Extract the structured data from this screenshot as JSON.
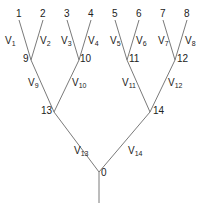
{
  "diagram": {
    "type": "binary-tree",
    "colors": {
      "edge": "#7a7a7a",
      "text": "#222222",
      "background": "#ffffff"
    },
    "nodes": [
      {
        "id": "1",
        "label": "1",
        "x": 19,
        "y": 20,
        "lx": 16,
        "ly": 9,
        "kind": "leaf"
      },
      {
        "id": "2",
        "label": "2",
        "x": 43,
        "y": 20,
        "lx": 40,
        "ly": 9,
        "kind": "leaf"
      },
      {
        "id": "3",
        "label": "3",
        "x": 67,
        "y": 20,
        "lx": 64,
        "ly": 9,
        "kind": "leaf"
      },
      {
        "id": "4",
        "label": "4",
        "x": 91,
        "y": 20,
        "lx": 88,
        "ly": 9,
        "kind": "leaf"
      },
      {
        "id": "5",
        "label": "5",
        "x": 115,
        "y": 20,
        "lx": 112,
        "ly": 9,
        "kind": "leaf"
      },
      {
        "id": "6",
        "label": "6",
        "x": 139,
        "y": 20,
        "lx": 136,
        "ly": 9,
        "kind": "leaf"
      },
      {
        "id": "7",
        "label": "7",
        "x": 163,
        "y": 20,
        "lx": 160,
        "ly": 9,
        "kind": "leaf"
      },
      {
        "id": "8",
        "label": "8",
        "x": 187,
        "y": 20,
        "lx": 184,
        "ly": 9,
        "kind": "leaf"
      },
      {
        "id": "9",
        "label": "9",
        "x": 31,
        "y": 60,
        "lx": 23,
        "ly": 54,
        "kind": "internal"
      },
      {
        "id": "10",
        "label": "10",
        "x": 79,
        "y": 60,
        "lx": 80,
        "ly": 54,
        "kind": "internal"
      },
      {
        "id": "11",
        "label": "11",
        "x": 127,
        "y": 60,
        "lx": 129,
        "ly": 54,
        "kind": "internal"
      },
      {
        "id": "12",
        "label": "12",
        "x": 175,
        "y": 60,
        "lx": 177,
        "ly": 54,
        "kind": "internal"
      },
      {
        "id": "13",
        "label": "13",
        "x": 54,
        "y": 112,
        "lx": 41,
        "ly": 106,
        "kind": "internal"
      },
      {
        "id": "14",
        "label": "14",
        "x": 150,
        "y": 112,
        "lx": 153,
        "ly": 106,
        "kind": "internal"
      },
      {
        "id": "0",
        "label": "0",
        "x": 99,
        "y": 172,
        "lx": 101,
        "ly": 168,
        "kind": "root"
      }
    ],
    "edges": [
      {
        "from": "1",
        "to": "9",
        "label": "V",
        "sub": "1",
        "lx": 5,
        "ly": 36
      },
      {
        "from": "2",
        "to": "9",
        "label": "V",
        "sub": "2",
        "lx": 40,
        "ly": 36
      },
      {
        "from": "3",
        "to": "10",
        "label": "V",
        "sub": "3",
        "lx": 61,
        "ly": 36
      },
      {
        "from": "4",
        "to": "10",
        "label": "V",
        "sub": "4",
        "lx": 88,
        "ly": 36
      },
      {
        "from": "5",
        "to": "11",
        "label": "V",
        "sub": "5",
        "lx": 110,
        "ly": 36
      },
      {
        "from": "6",
        "to": "11",
        "label": "V",
        "sub": "6",
        "lx": 136,
        "ly": 36
      },
      {
        "from": "7",
        "to": "12",
        "label": "V",
        "sub": "7",
        "lx": 158,
        "ly": 36
      },
      {
        "from": "8",
        "to": "12",
        "label": "V",
        "sub": "8",
        "lx": 185,
        "ly": 36
      },
      {
        "from": "9",
        "to": "13",
        "label": "V",
        "sub": "9",
        "lx": 28,
        "ly": 78
      },
      {
        "from": "10",
        "to": "13",
        "label": "V",
        "sub": "10",
        "lx": 72,
        "ly": 78
      },
      {
        "from": "11",
        "to": "14",
        "label": "V",
        "sub": "11",
        "lx": 122,
        "ly": 78
      },
      {
        "from": "12",
        "to": "14",
        "label": "V",
        "sub": "12",
        "lx": 168,
        "ly": 78
      },
      {
        "from": "13",
        "to": "0",
        "label": "V",
        "sub": "13",
        "lx": 74,
        "ly": 146
      },
      {
        "from": "14",
        "to": "0",
        "label": "V",
        "sub": "14",
        "lx": 128,
        "ly": 146
      }
    ],
    "stem": {
      "from": "0",
      "x": 99,
      "y1": 172,
      "y2": 203
    }
  }
}
